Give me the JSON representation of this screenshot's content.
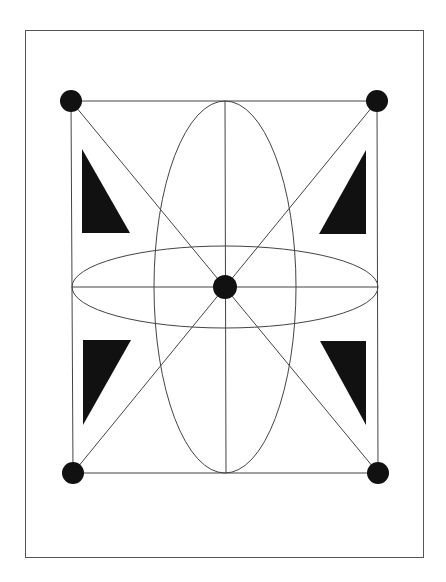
{
  "diagram": {
    "type": "geometric-figure",
    "colors": {
      "background": "#ffffff",
      "stroke": "#444444",
      "frame": "#555555",
      "fill": "#111111"
    },
    "elements": {
      "corner_dots": [
        "top-left",
        "top-right",
        "bottom-left",
        "bottom-right"
      ],
      "center_dot": "center",
      "triangles": [
        "top-left",
        "top-right",
        "bottom-left",
        "bottom-right"
      ],
      "ellipses": [
        "vertical",
        "horizontal"
      ],
      "lines": [
        "rectangle-top",
        "rectangle-bottom",
        "rectangle-left",
        "rectangle-right",
        "diagonal-tl-br",
        "diagonal-tr-bl",
        "horizontal-axis",
        "vertical-axis"
      ]
    }
  }
}
